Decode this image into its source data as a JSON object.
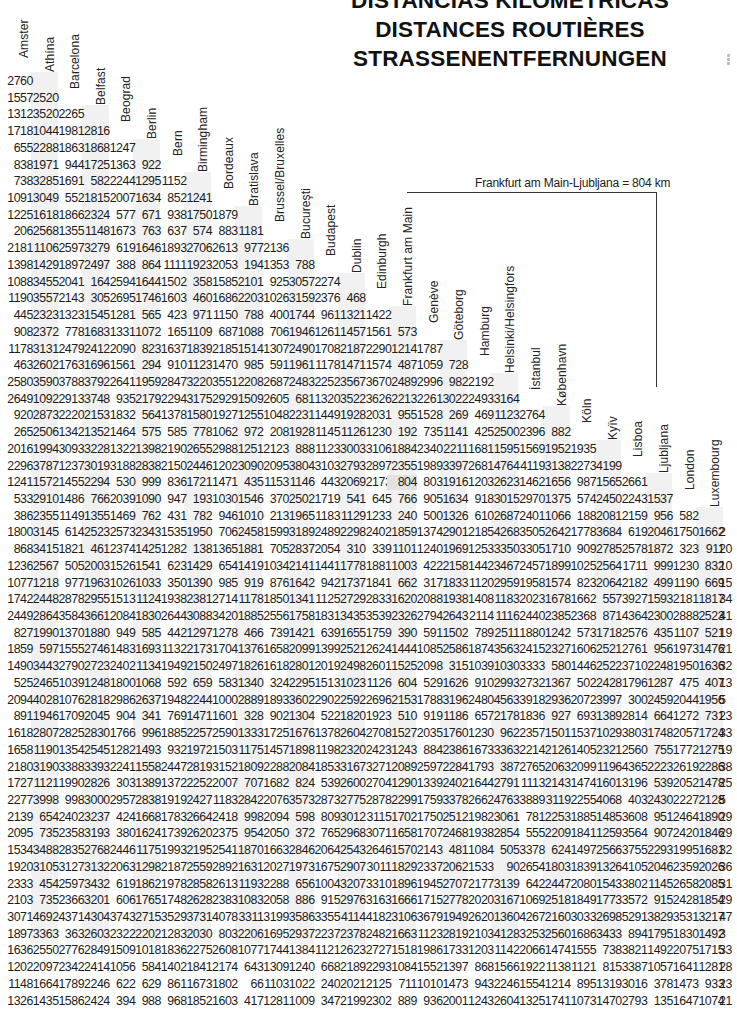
{
  "title": {
    "lines": [
      "DISTANCIAS KILOMETRICAS",
      "DISTANCES ROUTIÈRES",
      "STRASSENENTFERNUNGEN"
    ]
  },
  "example": {
    "text": "Frankfurt am Main-Ljubljana = 804 km",
    "from": "Frankfurt am Main",
    "to": "Ljubljana",
    "value": "804",
    "unit": "km"
  },
  "cities": [
    "Amsterdam",
    "Athína",
    "Barcelona",
    "Belfast",
    "Beograd",
    "Berlin",
    "Bern",
    "Birmingham",
    "Bordeaux",
    "Bratislava",
    "Brussel/Bruxelles",
    "Bucureşti",
    "Budapest",
    "Dublin",
    "Edinburgh",
    "Frankfurt am Main",
    "Genève",
    "Göteborg",
    "Hamburg",
    "Helsinki/Helsingfors",
    "İstanbul",
    "København",
    "Köln",
    "Kyïv",
    "Lisboa",
    "Ljubljana",
    "London",
    "Luxembourg"
  ],
  "header_labels_visible": [
    "Amster",
    "Athína",
    "Barcelona",
    "Belfast",
    "Beograd",
    "Berlin",
    "Bern",
    "Birmingham",
    "Bordeaux",
    "Bratislava",
    "Brussel/Bruxelles",
    "Bucureşti",
    "Budapest",
    "Dublin",
    "Edinburgh",
    "Frankfurt am Main",
    "Genève",
    "Göteborg",
    "Hamburg",
    "Helsinki/Helsingfors",
    "İstanbul",
    "København",
    "Köln",
    "Kyïv",
    "Lisboa",
    "Ljubljana",
    "London",
    "Luxembourg"
  ],
  "rows": [
    [
      "2760"
    ],
    [
      "1557",
      "2520"
    ],
    [
      "1312",
      "3520",
      "2265"
    ],
    [
      "1718",
      "1044",
      "1981",
      "2816"
    ],
    [
      "655",
      "2288",
      "1863",
      "1868",
      "1247"
    ],
    [
      "838",
      "1971",
      "944",
      "1725",
      "1363",
      "922"
    ],
    [
      "738",
      "3285",
      "1691",
      "582",
      "2244",
      "1295",
      "1152"
    ],
    [
      "1091",
      "3049",
      "552",
      "1815",
      "2007",
      "1634",
      "852",
      "1241"
    ],
    [
      "1225",
      "1618",
      "1866",
      "2324",
      "577",
      "671",
      "938",
      "1750",
      "1879"
    ],
    [
      "206",
      "2568",
      "1355",
      "1148",
      "1673",
      "763",
      "637",
      "574",
      "883",
      "1181"
    ],
    [
      "2181",
      "1106",
      "2597",
      "3279",
      "619",
      "1646",
      "1893",
      "2706",
      "2613",
      "977",
      "2136"
    ],
    [
      "1398",
      "1429",
      "1897",
      "2497",
      "388",
      "864",
      "1111",
      "1923",
      "2053",
      "194",
      "1353",
      "788"
    ],
    [
      "1088",
      "3455",
      "2041",
      "164",
      "2594",
      "1644",
      "1502",
      "358",
      "1585",
      "2101",
      "925",
      "3057",
      "2274"
    ],
    [
      "1190",
      "3557",
      "2143",
      "305",
      "2695",
      "1746",
      "1603",
      "460",
      "1686",
      "2203",
      "1026",
      "3159",
      "2376",
      "468"
    ],
    [
      "445",
      "2323",
      "1323",
      "1545",
      "1281",
      "565",
      "423",
      "971",
      "1150",
      "788",
      "400",
      "1744",
      "961",
      "1321",
      "1422"
    ],
    [
      "908",
      "2372",
      "778",
      "1683",
      "1331",
      "1072",
      "165",
      "1109",
      "687",
      "1088",
      "706",
      "1946",
      "1261",
      "1457",
      "1561",
      "573"
    ],
    [
      "1178",
      "3131",
      "2479",
      "2412",
      "2090",
      "823",
      "1637",
      "1839",
      "2185",
      "1514",
      "1307",
      "2490",
      "1708",
      "2187",
      "2290",
      "1214",
      "1787"
    ],
    [
      "463",
      "2602",
      "1763",
      "1696",
      "1561",
      "294",
      "910",
      "1123",
      "1470",
      "985",
      "591",
      "1961",
      "1178",
      "1471",
      "1574",
      "487",
      "1059",
      "728"
    ],
    [
      "2580",
      "3590",
      "3788",
      "3792",
      "2641",
      "1959",
      "2847",
      "3220",
      "3551",
      "2208",
      "2687",
      "2483",
      "2252",
      "3567",
      "3670",
      "2489",
      "2996",
      "982",
      "2192"
    ],
    [
      "2649",
      "1092",
      "2913",
      "3748",
      "935",
      "2179",
      "2294",
      "3175",
      "2929",
      "1509",
      "2605",
      "681",
      "1320",
      "3522",
      "3626",
      "2213",
      "2261",
      "3022",
      "2493",
      "3164"
    ],
    [
      "920",
      "2873",
      "2220",
      "2153",
      "1832",
      "564",
      "1378",
      "1580",
      "1927",
      "1255",
      "1048",
      "2231",
      "1449",
      "1928",
      "2031",
      "955",
      "1528",
      "269",
      "469",
      "1123",
      "2764"
    ],
    [
      "265",
      "2506",
      "1342",
      "1352",
      "1464",
      "575",
      "585",
      "778",
      "1062",
      "972",
      "208",
      "1928",
      "1145",
      "1126",
      "1230",
      "192",
      "735",
      "1141",
      "425",
      "2500",
      "2396",
      "882"
    ],
    [
      "2016",
      "1994",
      "3093",
      "3228",
      "1322",
      "1398",
      "2190",
      "2655",
      "2988",
      "1251",
      "2123",
      "888",
      "1123",
      "3003",
      "3106",
      "1884",
      "2340",
      "2211",
      "1681",
      "1595",
      "1569",
      "1952",
      "1935"
    ],
    [
      "2296",
      "3787",
      "1237",
      "3019",
      "3188",
      "2838",
      "2150",
      "2446",
      "1202",
      "3090",
      "2095",
      "3804",
      "3103",
      "2793",
      "2897",
      "2355",
      "1989",
      "3397",
      "2681",
      "4764",
      "4119",
      "3138",
      "2273",
      "4199"
    ],
    [
      "1241",
      "1572",
      "1455",
      "2294",
      "530",
      "999",
      "836",
      "1721",
      "1471",
      "435",
      "1153",
      "1146",
      "443",
      "2069",
      "2173",
      "804",
      "803",
      "1916",
      "1203",
      "2623",
      "1462",
      "1656",
      "987",
      "1565",
      "2661"
    ],
    [
      "533",
      "2910",
      "1486",
      "766",
      "2039",
      "1090",
      "947",
      "193",
      "1030",
      "1546",
      "370",
      "2502",
      "1719",
      "541",
      "645",
      "766",
      "905",
      "1634",
      "918",
      "3015",
      "2970",
      "1375",
      "574",
      "2450",
      "2243",
      "1537"
    ],
    [
      "386",
      "2355",
      "1149",
      "1355",
      "1469",
      "762",
      "431",
      "782",
      "946",
      "1010",
      "213",
      "1965",
      "1183",
      "1129",
      "1233",
      "240",
      "500",
      "1326",
      "610",
      "2687",
      "2401",
      "1066",
      "188",
      "2081",
      "2159",
      "956",
      "582"
    ],
    [
      "1800",
      "3145",
      "614",
      "2523",
      "2573",
      "2343",
      "1535",
      "1950",
      "706",
      "2458",
      "1599",
      "3189",
      "2489",
      "2298",
      "2402",
      "1859",
      "1374",
      "2901",
      "2185",
      "4268",
      "3505",
      "2642",
      "1778",
      "3684",
      "619",
      "2046",
      "1750",
      "1662"
    ],
    [
      "868",
      "3415",
      "1821",
      "461",
      "2374",
      "1425",
      "1282",
      "138",
      "1365",
      "1881",
      "705",
      "2837",
      "2054",
      "310",
      "339",
      "1101",
      "1240",
      "1969",
      "1253",
      "3350",
      "3305",
      "1710",
      "909",
      "2785",
      "2578",
      "1872",
      "323",
      "911"
    ],
    [
      "1236",
      "2567",
      "505",
      "2003",
      "1526",
      "1541",
      "623",
      "1429",
      "654",
      "1419",
      "1034",
      "2141",
      "1441",
      "1778",
      "1881",
      "1003",
      "422",
      "2158",
      "1442",
      "3467",
      "2457",
      "1899",
      "1025",
      "2564",
      "1711",
      "999",
      "1230",
      "832"
    ],
    [
      "1077",
      "1218",
      "977",
      "1963",
      "1026",
      "1033",
      "350",
      "1390",
      "985",
      "919",
      "876",
      "1642",
      "942",
      "1737",
      "1841",
      "662",
      "317",
      "1833",
      "1120",
      "2959",
      "1958",
      "1574",
      "823",
      "2064",
      "2182",
      "499",
      "1190",
      "669"
    ],
    [
      "1742",
      "2448",
      "2878",
      "2955",
      "1513",
      "1124",
      "1938",
      "2381",
      "2714",
      "1178",
      "1850",
      "1341",
      "1125",
      "2729",
      "2833",
      "1620",
      "2088",
      "1938",
      "1408",
      "1183",
      "2023",
      "1678",
      "1662",
      "557",
      "3927",
      "1593",
      "2181",
      "1817"
    ],
    [
      "2449",
      "2864",
      "3584",
      "3661",
      "2084",
      "1830",
      "2644",
      "3088",
      "3420",
      "1885",
      "2556",
      "1758",
      "1831",
      "3435",
      "3539",
      "2326",
      "2794",
      "2643",
      "2114",
      "1116",
      "2440",
      "2385",
      "2368",
      "871",
      "4364",
      "2300",
      "2888",
      "2523"
    ],
    [
      "827",
      "1990",
      "1370",
      "1880",
      "949",
      "585",
      "442",
      "1297",
      "1278",
      "466",
      "739",
      "1421",
      "639",
      "1655",
      "1759",
      "390",
      "591",
      "1502",
      "789",
      "2511",
      "1880",
      "1242",
      "573",
      "1718",
      "2576",
      "435",
      "1107",
      "521"
    ],
    [
      "1859",
      "597",
      "1555",
      "2746",
      "1483",
      "1693",
      "1132",
      "2173",
      "1704",
      "1376",
      "1658",
      "2099",
      "1399",
      "2521",
      "2624",
      "1444",
      "1085",
      "2586",
      "1874",
      "3563",
      "2415",
      "2327",
      "1606",
      "2521",
      "2761",
      "956",
      "1973",
      "1476"
    ],
    [
      "1490",
      "3443",
      "2790",
      "2723",
      "2402",
      "1134",
      "1949",
      "2150",
      "2497",
      "1826",
      "1618",
      "2801",
      "2019",
      "2498",
      "2601",
      "1525",
      "2098",
      "315",
      "1039",
      "1030",
      "3333",
      "580",
      "1446",
      "2522",
      "3710",
      "2248",
      "1950",
      "1636"
    ],
    [
      "525",
      "2465",
      "1039",
      "1248",
      "1800",
      "1068",
      "592",
      "659",
      "583",
      "1340",
      "324",
      "2295",
      "1513",
      "1023",
      "1126",
      "604",
      "529",
      "1626",
      "910",
      "2993",
      "2732",
      "1367",
      "502",
      "2428",
      "1796",
      "1287",
      "475",
      "407"
    ],
    [
      "2094",
      "4028",
      "1076",
      "2818",
      "2986",
      "2637",
      "1948",
      "2244",
      "1000",
      "2889",
      "1893",
      "3602",
      "2902",
      "2592",
      "2696",
      "2153",
      "1788",
      "3196",
      "2480",
      "4563",
      "3918",
      "2936",
      "2072",
      "3997",
      "300",
      "2459",
      "2044",
      "1956"
    ],
    [
      "891",
      "1946",
      "1709",
      "2045",
      "904",
      "341",
      "769",
      "1471",
      "1601",
      "328",
      "902",
      "1304",
      "522",
      "1820",
      "1923",
      "510",
      "919",
      "1186",
      "657",
      "2178",
      "1836",
      "927",
      "693",
      "1389",
      "2814",
      "664",
      "1272",
      "731"
    ],
    [
      "1618",
      "2807",
      "2825",
      "2830",
      "1766",
      "996",
      "1885",
      "2257",
      "2590",
      "1333",
      "1725",
      "1676",
      "1378",
      "2604",
      "2708",
      "1527",
      "2035",
      "1760",
      "1230",
      "962",
      "2357",
      "1501",
      "1537",
      "1029",
      "3803",
      "1748",
      "2057",
      "1724"
    ],
    [
      "1658",
      "1190",
      "1354",
      "2545",
      "1282",
      "1493",
      "932",
      "1972",
      "1503",
      "1175",
      "1457",
      "1898",
      "1198",
      "2320",
      "2423",
      "1243",
      "884",
      "2386",
      "1673",
      "3363",
      "2214",
      "2126",
      "1405",
      "2321",
      "2560",
      "755",
      "1772",
      "1275"
    ],
    [
      "2180",
      "3190",
      "3388",
      "3393",
      "2241",
      "1558",
      "2447",
      "2819",
      "3152",
      "1809",
      "2288",
      "2084",
      "1853",
      "3167",
      "3271",
      "2089",
      "2597",
      "2284",
      "1793",
      "387",
      "2765",
      "2063",
      "2099",
      "1196",
      "4365",
      "2223",
      "2619",
      "2286"
    ],
    [
      "1727",
      "1121",
      "1990",
      "2826",
      "303",
      "1389",
      "1372",
      "2252",
      "2007",
      "707",
      "1682",
      "824",
      "539",
      "2600",
      "2704",
      "1290",
      "1339",
      "2402",
      "1644",
      "2791",
      "1113",
      "2143",
      "1474",
      "1601",
      "3196",
      "539",
      "2052",
      "1478"
    ],
    [
      "2277",
      "3998",
      "998",
      "3000",
      "2957",
      "2838",
      "1919",
      "2427",
      "1183",
      "2842",
      "2076",
      "3573",
      "2873",
      "2775",
      "2878",
      "2299",
      "1759",
      "3378",
      "2662",
      "4763",
      "3889",
      "3119",
      "2255",
      "4068",
      "403",
      "2430",
      "2227",
      "2128"
    ],
    [
      "2139",
      "654",
      "2402",
      "3237",
      "424",
      "1668",
      "1783",
      "2664",
      "2418",
      "998",
      "2094",
      "598",
      "809",
      "3012",
      "3115",
      "1702",
      "1750",
      "2512",
      "1982",
      "3061",
      "781",
      "2253",
      "1885",
      "1485",
      "3608",
      "951",
      "2464",
      "1890"
    ],
    [
      "2095",
      "735",
      "2358",
      "3193",
      "380",
      "1624",
      "1739",
      "2620",
      "2375",
      "954",
      "2050",
      "372",
      "765",
      "2968",
      "3071",
      "1658",
      "1707",
      "2468",
      "1938",
      "2854",
      "555",
      "2209",
      "1841",
      "1259",
      "3564",
      "907",
      "2420",
      "1846"
    ],
    [
      "1534",
      "3488",
      "2835",
      "2768",
      "2446",
      "1175",
      "1993",
      "2195",
      "2541",
      "1870",
      "1663",
      "2846",
      "2064",
      "2543",
      "2646",
      "1570",
      "2143",
      "481",
      "1084",
      "505",
      "3378",
      "624",
      "1497",
      "2566",
      "3755",
      "2293",
      "1995",
      "1681"
    ],
    [
      "1920",
      "3105",
      "3127",
      "3132",
      "2063",
      "1298",
      "2187",
      "2559",
      "2892",
      "1631",
      "2027",
      "1973",
      "1675",
      "2907",
      "3011",
      "1829",
      "2337",
      "2062",
      "1533",
      "90",
      "2654",
      "1803",
      "1839",
      "1326",
      "4105",
      "2046",
      "2359",
      "2026"
    ],
    [
      "2333",
      "454",
      "2597",
      "3432",
      "619",
      "1862",
      "1978",
      "2858",
      "2613",
      "1193",
      "2288",
      "656",
      "1004",
      "3207",
      "3310",
      "1896",
      "1945",
      "2707",
      "2177",
      "3139",
      "642",
      "2447",
      "2080",
      "1543",
      "3802",
      "1145",
      "2658",
      "2085"
    ],
    [
      "2103",
      "735",
      "2366",
      "3201",
      "606",
      "1765",
      "1748",
      "2628",
      "2383",
      "1083",
      "2058",
      "886",
      "915",
      "2976",
      "3163",
      "1666",
      "1715",
      "2778",
      "2020",
      "3167",
      "1069",
      "2518",
      "1849",
      "1773",
      "3572",
      "915",
      "2428",
      "1854"
    ],
    [
      "3071",
      "4692",
      "4371",
      "4304",
      "3743",
      "2715",
      "3529",
      "3731",
      "4078",
      "3311",
      "3199",
      "3586",
      "3355",
      "4114",
      "4182",
      "3106",
      "3679",
      "1949",
      "2620",
      "1360",
      "4267",
      "2160",
      "3033",
      "2698",
      "5291",
      "3829",
      "3531",
      "3217"
    ],
    [
      "1897",
      "3363",
      "363",
      "2603",
      "2322",
      "2202",
      "1283",
      "2030",
      "803",
      "2206",
      "1695",
      "2937",
      "2237",
      "2378",
      "2482",
      "1663",
      "1123",
      "2819",
      "2103",
      "4128",
      "3253",
      "2560",
      "1686",
      "3433",
      "894",
      "1795",
      "1830",
      "1492"
    ],
    [
      "1636",
      "2550",
      "2776",
      "2849",
      "1509",
      "1018",
      "1836",
      "2275",
      "2608",
      "1077",
      "1744",
      "1384",
      "1121",
      "2623",
      "2727",
      "1518",
      "1986",
      "1733",
      "1203",
      "1142",
      "2066",
      "1474",
      "1555",
      "738",
      "3821",
      "1492",
      "2075",
      "1715"
    ],
    [
      "1202",
      "2097",
      "2342",
      "2414",
      "1056",
      "584",
      "1402",
      "1841",
      "2174",
      "643",
      "1309",
      "1240",
      "668",
      "2189",
      "2293",
      "1084",
      "1552",
      "1397",
      "868",
      "1566",
      "1922",
      "1138",
      "1121",
      "815",
      "3387",
      "1057",
      "1641",
      "1281"
    ],
    [
      "1148",
      "1664",
      "1789",
      "2246",
      "622",
      "629",
      "861",
      "1673",
      "1802",
      "66",
      "1103",
      "1022",
      "240",
      "2021",
      "2125",
      "711",
      "1010",
      "1473",
      "943",
      "2246",
      "1554",
      "1214",
      "895",
      "1319",
      "3016",
      "378",
      "1473",
      "933"
    ],
    [
      "1326",
      "1435",
      "1586",
      "2424",
      "394",
      "988",
      "968",
      "1852",
      "1603",
      "417",
      "1281",
      "1009",
      "347",
      "2199",
      "2302",
      "889",
      "936",
      "2001",
      "1243",
      "2604",
      "1325",
      "1741",
      "1073",
      "1470",
      "2793",
      "135",
      "1647",
      "1074"
    ]
  ],
  "right_edge_partial": [
    "2",
    "20",
    "10",
    "15",
    "34",
    "41",
    "19",
    "21",
    "32",
    "13",
    "5",
    "23",
    "33",
    "19",
    "38",
    "25",
    "5",
    "29",
    "29",
    "32",
    "36",
    "31",
    "29",
    "47",
    "3",
    "33",
    "28",
    "23",
    "21"
  ],
  "highlight": {
    "row": 24,
    "col": 15,
    "value": "804"
  }
}
